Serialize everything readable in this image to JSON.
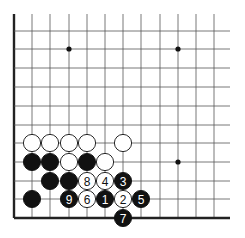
{
  "board": {
    "cols_x": [
      14,
      32,
      50,
      69,
      87,
      105,
      123,
      141,
      160,
      178,
      196,
      214
    ],
    "rows_y": [
      31,
      49,
      68,
      87,
      106,
      125,
      143,
      162,
      181,
      199,
      218
    ],
    "grid_top": 14,
    "grid_right": 230,
    "left_edge_x": 14,
    "bottom_edge_y": 218,
    "line_color": "#555555",
    "edge_color": "#222222",
    "stone_radius": 8.6
  },
  "star_points": [
    {
      "x": 69,
      "y": 49
    },
    {
      "x": 178,
      "y": 49
    },
    {
      "x": 178,
      "y": 162
    }
  ],
  "stones": [
    {
      "color": "white",
      "x": 32,
      "y": 143,
      "label": ""
    },
    {
      "color": "white",
      "x": 50,
      "y": 143,
      "label": ""
    },
    {
      "color": "white",
      "x": 69,
      "y": 143,
      "label": ""
    },
    {
      "color": "white",
      "x": 87,
      "y": 143,
      "label": ""
    },
    {
      "color": "white",
      "x": 123,
      "y": 143,
      "label": ""
    },
    {
      "color": "black",
      "x": 32,
      "y": 162,
      "label": ""
    },
    {
      "color": "black",
      "x": 50,
      "y": 162,
      "label": ""
    },
    {
      "color": "white",
      "x": 69,
      "y": 162,
      "label": ""
    },
    {
      "color": "black",
      "x": 87,
      "y": 162,
      "label": ""
    },
    {
      "color": "white",
      "x": 105,
      "y": 162,
      "label": ""
    },
    {
      "color": "black",
      "x": 50,
      "y": 181,
      "label": ""
    },
    {
      "color": "black",
      "x": 69,
      "y": 181,
      "label": ""
    },
    {
      "color": "white",
      "x": 87,
      "y": 181,
      "label": "8"
    },
    {
      "color": "white",
      "x": 105,
      "y": 181,
      "label": "4"
    },
    {
      "color": "black",
      "x": 123,
      "y": 181,
      "label": "3"
    },
    {
      "color": "black",
      "x": 32,
      "y": 199,
      "label": ""
    },
    {
      "color": "black",
      "x": 69,
      "y": 199,
      "label": "9"
    },
    {
      "color": "white",
      "x": 87,
      "y": 199,
      "label": "6"
    },
    {
      "color": "black",
      "x": 105,
      "y": 199,
      "label": "1"
    },
    {
      "color": "white",
      "x": 123,
      "y": 199,
      "label": "2"
    },
    {
      "color": "black",
      "x": 141,
      "y": 199,
      "label": "5"
    },
    {
      "color": "black",
      "x": 123,
      "y": 218,
      "label": "7"
    }
  ]
}
